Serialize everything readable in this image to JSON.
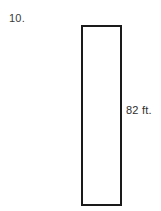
{
  "figure": {
    "problem_number": "10.",
    "background_color": "#ffffff",
    "shape": {
      "name": "rectangle",
      "fill_color": "#ffffff",
      "stroke_color": "#1a1a1a",
      "stroke_width": 2
    },
    "labels": {
      "side_length": "82 ft."
    }
  }
}
